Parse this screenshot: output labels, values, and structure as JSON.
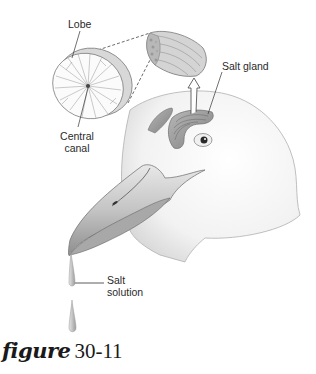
{
  "figure": {
    "caption_word": "figure",
    "caption_number": "30-11"
  },
  "labels": {
    "lobe": "Lobe",
    "central_canal_line1": "Central",
    "central_canal_line2": "canal",
    "salt_gland": "Salt gland",
    "salt_solution_line1": "Salt",
    "salt_solution_line2": "solution"
  },
  "colors": {
    "line": "#333333",
    "gland_fill": "#9a9a9a",
    "head_fill": "#f4f4f4",
    "beak_fill": "#cfcfcf"
  }
}
